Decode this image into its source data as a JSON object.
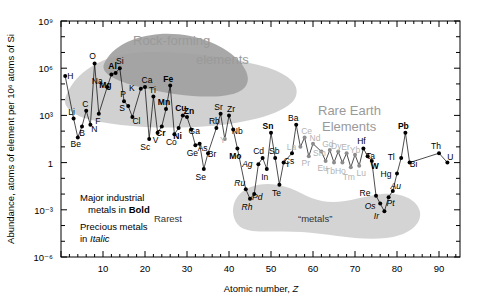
{
  "figure": {
    "name": "solar-system-elemental-abundance-chart",
    "background": "#ffffff",
    "frame_color": "#000000"
  },
  "axes": {
    "x": {
      "title_plain": "Atomic number, ",
      "title_italic": "Z",
      "ticks": [
        10,
        20,
        30,
        40,
        50,
        60,
        70,
        80,
        90
      ],
      "min": 0,
      "max": 95,
      "minor_tick_step": 2
    },
    "y": {
      "title": "Abundance, atoms of element per 10⁶ atoms of Si",
      "ticks": [
        "10⁹",
        "10⁶",
        "10³",
        "1",
        "10⁻³",
        "10⁻⁶"
      ],
      "tick_exponents": [
        9,
        6,
        3,
        0,
        -3,
        -6
      ],
      "min_exp": -6,
      "max_exp": 9,
      "scale": "log"
    }
  },
  "annotations": {
    "rock_forming_line1": "Rock-forming",
    "rock_forming_line2": "elements",
    "rare_earth_line1": "Rare Earth",
    "rare_earth_line2": "Elements",
    "legend_bold_line1": "Major industrial",
    "legend_bold_line2_plain": "metals in ",
    "legend_bold_line2_bold": "Bold",
    "legend_italic_line1": "Precious metals",
    "legend_italic_line2_plain": "in ",
    "legend_italic_line2_italic": "Italic",
    "rarest": "Rarest",
    "metals_quoted": "“metals”"
  },
  "colors": {
    "rock_blob_dark": "#9e9e9e",
    "rock_blob_light": "#c9c9c9",
    "rarest_blob": "#d2d2d2",
    "rare_earth_text": "#9a9a9a",
    "marker": "#000000",
    "line": "#000000",
    "rare_earth_marker": "#8c8c8c"
  },
  "chart_data": {
    "type": "scatter",
    "title": "",
    "xlabel": "Atomic number, Z",
    "ylabel": "Abundance, atoms of element per 10^6 atoms of Si",
    "xlim": [
      0,
      95
    ],
    "ylim_exp": [
      -6,
      9
    ],
    "yscale": "log",
    "grid": false,
    "legend": "none",
    "note": "Solar-system abundance of the chemical elements, normalised to 10^6 atoms of Si. Values are log10 of abundance.",
    "points": [
      {
        "symbol": "H",
        "z": 1,
        "log_abundance": 5.5,
        "style": "normal",
        "label_dx": 5,
        "label_dy": 3
      },
      {
        "symbol": "Li",
        "z": 3,
        "log_abundance": 2.8,
        "style": "normal",
        "label_dx": -2,
        "label_dy": -4
      },
      {
        "symbol": "Be",
        "z": 4,
        "log_abundance": 1.6,
        "style": "normal",
        "label_dx": -2,
        "label_dy": 10
      },
      {
        "symbol": "B",
        "z": 5,
        "log_abundance": 2.3,
        "style": "normal",
        "label_dx": 0,
        "label_dy": 10
      },
      {
        "symbol": "C",
        "z": 6,
        "log_abundance": 3.3,
        "style": "normal",
        "label_dx": -1,
        "label_dy": -4
      },
      {
        "symbol": "N",
        "z": 7,
        "log_abundance": 2.4,
        "style": "normal",
        "label_dx": 4,
        "label_dy": 7
      },
      {
        "symbol": "O",
        "z": 8,
        "log_abundance": 6.3,
        "style": "normal",
        "label_dx": -2,
        "label_dy": -4
      },
      {
        "symbol": "F",
        "z": 9,
        "log_abundance": 3.1,
        "style": "normal",
        "label_dx": -1,
        "label_dy": 10
      },
      {
        "symbol": "Na",
        "z": 11,
        "log_abundance": 4.8,
        "style": "normal",
        "label_dx": -10,
        "label_dy": -3
      },
      {
        "symbol": "Mg",
        "z": 12,
        "log_abundance": 5.6,
        "style": "bold",
        "label_dx": -6,
        "label_dy": 14
      },
      {
        "symbol": "Al",
        "z": 13,
        "log_abundance": 5.7,
        "style": "bold",
        "label_dx": -3,
        "label_dy": -4
      },
      {
        "symbol": "Si",
        "z": 14,
        "log_abundance": 6.0,
        "style": "normal",
        "label_dx": 0,
        "label_dy": -4
      },
      {
        "symbol": "P",
        "z": 15,
        "log_abundance": 3.9,
        "style": "normal",
        "label_dx": -1,
        "label_dy": -4
      },
      {
        "symbol": "S",
        "z": 16,
        "log_abundance": 3.6,
        "style": "normal",
        "label_dx": -6,
        "label_dy": 5
      },
      {
        "symbol": "Cl",
        "z": 17,
        "log_abundance": 2.9,
        "style": "normal",
        "label_dx": 4,
        "label_dy": 7
      },
      {
        "symbol": "K",
        "z": 19,
        "log_abundance": 4.7,
        "style": "normal",
        "label_dx": -9,
        "label_dy": 2
      },
      {
        "symbol": "Ca",
        "z": 20,
        "log_abundance": 4.8,
        "style": "normal",
        "label_dx": 2,
        "label_dy": -4
      },
      {
        "symbol": "Sc",
        "z": 21,
        "log_abundance": 1.5,
        "style": "normal",
        "label_dx": -4,
        "label_dy": 11
      },
      {
        "symbol": "Ti",
        "z": 22,
        "log_abundance": 4.2,
        "style": "normal",
        "label_dx": -1,
        "label_dy": -4
      },
      {
        "symbol": "V",
        "z": 23,
        "log_abundance": 1.9,
        "style": "normal",
        "label_dx": -2,
        "label_dy": 10
      },
      {
        "symbol": "Cr",
        "z": 24,
        "log_abundance": 2.3,
        "style": "bold",
        "label_dx": -1,
        "label_dy": 10
      },
      {
        "symbol": "Mn",
        "z": 25,
        "log_abundance": 3.4,
        "style": "bold",
        "label_dx": -2,
        "label_dy": -4
      },
      {
        "symbol": "Fe",
        "z": 26,
        "log_abundance": 4.9,
        "style": "bold",
        "label_dx": -2,
        "label_dy": -4
      },
      {
        "symbol": "Co",
        "z": 27,
        "log_abundance": 1.8,
        "style": "normal",
        "label_dx": -3,
        "label_dy": 11
      },
      {
        "symbol": "Ni",
        "z": 28,
        "log_abundance": 2.2,
        "style": "bold",
        "label_dx": -1,
        "label_dy": 11
      },
      {
        "symbol": "Cu",
        "z": 29,
        "log_abundance": 3.0,
        "style": "bold",
        "label_dx": -2,
        "label_dy": -4
      },
      {
        "symbol": "Zn",
        "z": 30,
        "log_abundance": 2.9,
        "style": "bold",
        "label_dx": 2,
        "label_dy": -3
      },
      {
        "symbol": "Ga",
        "z": 31,
        "log_abundance": 2.1,
        "style": "normal",
        "label_dx": 3,
        "label_dy": 4
      },
      {
        "symbol": "Ge",
        "z": 32,
        "log_abundance": 1.1,
        "style": "normal",
        "label_dx": -3,
        "label_dy": 11
      },
      {
        "symbol": "As",
        "z": 33,
        "log_abundance": 1.2,
        "style": "normal",
        "label_dx": 3,
        "label_dy": 7
      },
      {
        "symbol": "Se",
        "z": 34,
        "log_abundance": -0.4,
        "style": "normal",
        "label_dx": -3,
        "label_dy": 11
      },
      {
        "symbol": "Br",
        "z": 35,
        "log_abundance": 0.6,
        "style": "normal",
        "label_dx": 4,
        "label_dy": 4
      },
      {
        "symbol": "Rb",
        "z": 37,
        "log_abundance": 2.2,
        "style": "normal",
        "label_dx": -2,
        "label_dy": -4
      },
      {
        "symbol": "Sr",
        "z": 38,
        "log_abundance": 3.1,
        "style": "normal",
        "label_dx": -2,
        "label_dy": -4
      },
      {
        "symbol": "Y",
        "z": 39,
        "log_abundance": 1.5,
        "style": "gray",
        "label_dx": -2,
        "label_dy": 4
      },
      {
        "symbol": "Zr",
        "z": 40,
        "log_abundance": 3.0,
        "style": "normal",
        "label_dx": 2,
        "label_dy": -3
      },
      {
        "symbol": "Nb",
        "z": 41,
        "log_abundance": 2.1,
        "style": "normal",
        "label_dx": 4,
        "label_dy": 4
      },
      {
        "symbol": "Mo",
        "z": 42,
        "log_abundance": 0.9,
        "style": "bold",
        "label_dx": -2,
        "label_dy": 11
      },
      {
        "symbol": "Ru",
        "z": 44,
        "log_abundance": -1.7,
        "style": "italic",
        "label_dx": -6,
        "label_dy": -3
      },
      {
        "symbol": "Rh",
        "z": 45,
        "log_abundance": -2.3,
        "style": "italic",
        "label_dx": -3,
        "label_dy": 11
      },
      {
        "symbol": "Pd",
        "z": 46,
        "log_abundance": -2.0,
        "style": "italic",
        "label_dx": 3,
        "label_dy": 6
      },
      {
        "symbol": "Ag",
        "z": 47,
        "log_abundance": -0.1,
        "style": "italic",
        "label_dx": -11,
        "label_dy": 3
      },
      {
        "symbol": "Cd",
        "z": 48,
        "log_abundance": 0.3,
        "style": "normal",
        "label_dx": -4,
        "label_dy": -4
      },
      {
        "symbol": "In",
        "z": 49,
        "log_abundance": -0.4,
        "style": "normal",
        "label_dx": -2,
        "label_dy": 11
      },
      {
        "symbol": "Sn",
        "z": 50,
        "log_abundance": 1.9,
        "style": "bold",
        "label_dx": -3,
        "label_dy": -4
      },
      {
        "symbol": "Sb",
        "z": 51,
        "log_abundance": 0.3,
        "style": "normal",
        "label_dx": -1,
        "label_dy": -4
      },
      {
        "symbol": "Te",
        "z": 52,
        "log_abundance": -1.4,
        "style": "normal",
        "label_dx": -3,
        "label_dy": 11
      },
      {
        "symbol": "I",
        "z": 53,
        "log_abundance": 0.0,
        "style": "normal",
        "label_dx": 4,
        "label_dy": 4
      },
      {
        "symbol": "Cs",
        "z": 55,
        "log_abundance": 0.6,
        "style": "normal",
        "label_dx": -3,
        "label_dy": 11
      },
      {
        "symbol": "Ba",
        "z": 56,
        "log_abundance": 2.4,
        "style": "normal",
        "label_dx": -3,
        "label_dy": -4
      },
      {
        "symbol": "La",
        "z": 57,
        "log_abundance": 1.0,
        "style": "gray",
        "label_dx": -9,
        "label_dy": 3
      },
      {
        "symbol": "Ce",
        "z": 58,
        "log_abundance": 1.6,
        "style": "gray",
        "label_dx": 2,
        "label_dy": -3
      },
      {
        "symbol": "Pr",
        "z": 59,
        "log_abundance": 0.4,
        "style": "gray",
        "label_dx": -3,
        "label_dy": 10
      },
      {
        "symbol": "Nd",
        "z": 60,
        "log_abundance": 1.2,
        "style": "gray",
        "label_dx": 2,
        "label_dy": -3
      },
      {
        "symbol": "Sm",
        "z": 62,
        "log_abundance": 0.7,
        "style": "gray",
        "label_dx": -2,
        "label_dy": 4
      },
      {
        "symbol": "Eu",
        "z": 63,
        "log_abundance": 0.1,
        "style": "gray",
        "label_dx": -3,
        "label_dy": 10
      },
      {
        "symbol": "Gd",
        "z": 64,
        "log_abundance": 0.8,
        "style": "gray",
        "label_dx": -2,
        "label_dy": -3
      },
      {
        "symbol": "Tb",
        "z": 65,
        "log_abundance": 0.0,
        "style": "gray",
        "label_dx": -4,
        "label_dy": 11
      },
      {
        "symbol": "Dy",
        "z": 66,
        "log_abundance": 0.7,
        "style": "gray",
        "label_dx": -2,
        "label_dy": -3
      },
      {
        "symbol": "Ho",
        "z": 67,
        "log_abundance": 0.0,
        "style": "gray",
        "label_dx": -2,
        "label_dy": 11
      },
      {
        "symbol": "Er",
        "z": 68,
        "log_abundance": 0.6,
        "style": "gray",
        "label_dx": -1,
        "label_dy": -3
      },
      {
        "symbol": "Tm",
        "z": 69,
        "log_abundance": -0.3,
        "style": "gray",
        "label_dx": -2,
        "label_dy": 13
      },
      {
        "symbol": "Yb",
        "z": 70,
        "log_abundance": 0.5,
        "style": "gray",
        "label_dx": 0,
        "label_dy": -2
      },
      {
        "symbol": "Lu",
        "z": 71,
        "log_abundance": -0.2,
        "style": "gray",
        "label_dx": 2,
        "label_dy": 10
      },
      {
        "symbol": "Hf",
        "z": 72,
        "log_abundance": 0.9,
        "style": "normal",
        "label_dx": -2,
        "label_dy": -4
      },
      {
        "symbol": "Ta",
        "z": 73,
        "log_abundance": 0.4,
        "style": "normal",
        "label_dx": 3,
        "label_dy": 3
      },
      {
        "symbol": "W",
        "z": 74,
        "log_abundance": 0.1,
        "style": "bold",
        "label_dx": 3,
        "label_dy": 8
      },
      {
        "symbol": "Re",
        "z": 75,
        "log_abundance": -2.1,
        "style": "normal",
        "label_dx": -11,
        "label_dy": 0
      },
      {
        "symbol": "Os",
        "z": 76,
        "log_abundance": -2.6,
        "style": "italic",
        "label_dx": -10,
        "label_dy": 5
      },
      {
        "symbol": "Ir",
        "z": 77,
        "log_abundance": -3.1,
        "style": "italic",
        "label_dx": -8,
        "label_dy": 8
      },
      {
        "symbol": "Pt",
        "z": 78,
        "log_abundance": -2.2,
        "style": "italic",
        "label_dx": 2,
        "label_dy": 9
      },
      {
        "symbol": "Au",
        "z": 79,
        "log_abundance": -1.8,
        "style": "italic",
        "label_dx": 3,
        "label_dy": -2
      },
      {
        "symbol": "Hg",
        "z": 80,
        "log_abundance": -0.7,
        "style": "normal",
        "label_dx": -11,
        "label_dy": 3
      },
      {
        "symbol": "Tl",
        "z": 81,
        "log_abundance": 0.3,
        "style": "normal",
        "label_dx": -10,
        "label_dy": 2
      },
      {
        "symbol": "Pb",
        "z": 82,
        "log_abundance": 1.9,
        "style": "bold",
        "label_dx": -2,
        "label_dy": -4
      },
      {
        "symbol": "Bi",
        "z": 83,
        "log_abundance": 0.0,
        "style": "normal",
        "label_dx": 4,
        "label_dy": 4
      },
      {
        "symbol": "Th",
        "z": 90,
        "log_abundance": 0.6,
        "style": "normal",
        "label_dx": -3,
        "label_dy": -4
      },
      {
        "symbol": "U",
        "z": 92,
        "log_abundance": 0.0,
        "style": "normal",
        "label_dx": 3,
        "label_dy": -3
      }
    ],
    "polyline_z_order": [
      1,
      3,
      4,
      5,
      6,
      7,
      8,
      9,
      11,
      12,
      13,
      14,
      15,
      16,
      17,
      19,
      20,
      21,
      22,
      23,
      24,
      25,
      26,
      27,
      28,
      29,
      30,
      31,
      32,
      33,
      34,
      35,
      37,
      38,
      39,
      40,
      41,
      42,
      44,
      45,
      46,
      47,
      48,
      49,
      50,
      51,
      52,
      53,
      55,
      56,
      57,
      58,
      59,
      60,
      62,
      63,
      64,
      65,
      66,
      67,
      68,
      69,
      70,
      71,
      72,
      73,
      74,
      75,
      76,
      77,
      78,
      79,
      80,
      81,
      82,
      83,
      90,
      92
    ]
  }
}
